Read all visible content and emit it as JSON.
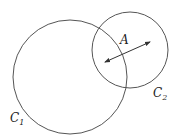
{
  "diagram": {
    "type": "venn-like two intersecting circles",
    "background": "#ffffff",
    "stroke_color": "#555555",
    "circles": [
      {
        "id": "C1",
        "label": "C",
        "subscript": "1",
        "cx": 70,
        "cy": 77,
        "r": 57,
        "label_x": 10,
        "label_y": 122
      },
      {
        "id": "C2",
        "label": "C",
        "subscript": "2",
        "cx": 130,
        "cy": 50,
        "r": 38,
        "label_x": 153,
        "label_y": 97
      }
    ],
    "region_label": {
      "text": "A",
      "x": 120,
      "y": 44
    },
    "arrow": {
      "type": "double-headed",
      "x1": 105,
      "y1": 62,
      "x2": 150,
      "y2": 42
    }
  }
}
